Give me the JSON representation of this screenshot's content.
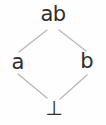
{
  "diagram": {
    "type": "hasse-lattice-diagram",
    "background_color": "#fefefe",
    "edge_color": "#b5b5b5",
    "label_color": "#2e2e2e",
    "nodes": [
      {
        "id": "top",
        "label": "ab",
        "x": 53,
        "y": 14,
        "role": "top-element"
      },
      {
        "id": "left",
        "label": "a",
        "x": 18,
        "y": 62,
        "role": "atom"
      },
      {
        "id": "right",
        "label": "b",
        "x": 87,
        "y": 61,
        "role": "atom"
      },
      {
        "id": "bottom",
        "label": "⊥",
        "x": 54,
        "y": 108,
        "role": "bottom-element"
      }
    ],
    "edges": [
      {
        "from": "left",
        "to": "top",
        "x1": 19,
        "y1": 52,
        "x2": 47,
        "y2": 30
      },
      {
        "from": "right",
        "to": "top",
        "x1": 59,
        "y1": 30,
        "x2": 86,
        "y2": 51
      },
      {
        "from": "bottom",
        "to": "left",
        "x1": 18,
        "y1": 74,
        "x2": 47,
        "y2": 98
      },
      {
        "from": "bottom",
        "to": "right",
        "x1": 60,
        "y1": 99,
        "x2": 87,
        "y2": 75
      }
    ]
  }
}
